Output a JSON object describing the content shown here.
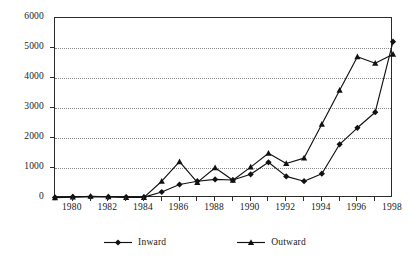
{
  "chart_data": {
    "type": "line",
    "title": "",
    "subtitle": "",
    "xlabel": "",
    "ylabel": "",
    "x": [
      1979,
      1980,
      1981,
      1982,
      1983,
      1984,
      1985,
      1986,
      1987,
      1988,
      1989,
      1990,
      1991,
      1992,
      1993,
      1994,
      1995,
      1996,
      1997,
      1998
    ],
    "xlim": [
      1979,
      1998
    ],
    "ylim": [
      0,
      6000
    ],
    "ytick_values": [
      0,
      1000,
      2000,
      3000,
      4000,
      5000,
      6000
    ],
    "ytick_labels": [
      "0",
      "1000",
      "2000",
      "3000",
      "4000",
      "5000",
      "6000"
    ],
    "xtick_values": [
      1980,
      1982,
      1984,
      1986,
      1988,
      1990,
      1992,
      1994,
      1996,
      1998
    ],
    "xtick_labels": [
      "1980",
      "1982",
      "1984",
      "1986",
      "1988",
      "1990",
      "1992",
      "1994",
      "1996",
      "1998"
    ],
    "xtick_minor_values": [
      1979,
      1981,
      1983,
      1985,
      1987,
      1989,
      1991,
      1993,
      1995,
      1997
    ],
    "grid": true,
    "grid_axis": "y",
    "grid_style": "dotted",
    "legend_position": "bottom",
    "series": [
      {
        "name": "Inward",
        "marker": "diamond",
        "color": "#111111",
        "values": [
          20,
          40,
          40,
          40,
          30,
          30,
          200,
          450,
          560,
          620,
          600,
          790,
          1190,
          720,
          560,
          810,
          1790,
          2340,
          2860,
          5210
        ]
      },
      {
        "name": "Outward",
        "marker": "triangle",
        "color": "#111111",
        "values": [
          10,
          30,
          60,
          40,
          20,
          20,
          560,
          1210,
          520,
          1010,
          590,
          1030,
          1490,
          1150,
          1330,
          2460,
          3590,
          4710,
          4490,
          4790
        ]
      }
    ]
  },
  "legend": {
    "entries": [
      {
        "label": "Inward",
        "marker": "diamond"
      },
      {
        "label": "Outward",
        "marker": "triangle"
      }
    ]
  }
}
